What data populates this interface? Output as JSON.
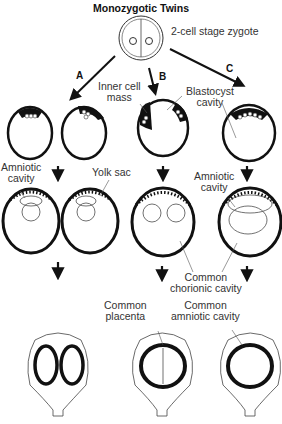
{
  "title": "Monozygotic Twins",
  "labels": {
    "zygote": "2-cell stage zygote",
    "pathA": "A",
    "pathB": "B",
    "pathC": "C",
    "inner_cell_mass": [
      "Inner cell",
      "mass"
    ],
    "blastocyst_cavity": [
      "Blastocyst",
      "cavity"
    ],
    "amniotic_cavity_left": [
      "Amniotic",
      "cavity"
    ],
    "yolk_sac": "Yolk sac",
    "amniotic_cavity_right": [
      "Amniotic",
      "cavity"
    ],
    "common_chorionic_cavity": [
      "Common",
      "chorionic cavity"
    ],
    "common_placenta": [
      "Common",
      "placenta"
    ],
    "common_amniotic_cavity": [
      "Common",
      "amniotic cavity"
    ]
  }
}
